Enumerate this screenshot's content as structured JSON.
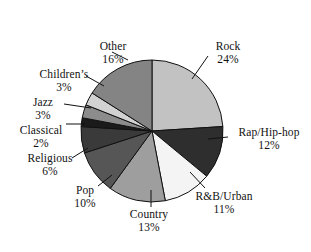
{
  "chart_data": {
    "type": "pie",
    "title": "",
    "subtitle": "",
    "xlabel": "",
    "ylabel": "",
    "legend_position": "none",
    "grid": false,
    "labels_outside": true,
    "value_unit": "%",
    "categories": [
      "Rock",
      "Rap/Hip-hop",
      "R&B/Urban",
      "Country",
      "Pop",
      "Religious",
      "Classical",
      "Jazz",
      "Children's",
      "Other"
    ],
    "values": [
      24,
      12,
      11,
      13,
      10,
      6,
      2,
      3,
      3,
      16
    ],
    "slices": [
      {
        "label": "Rock",
        "value": 24,
        "value_text": "24%",
        "color": "#c2c2c2"
      },
      {
        "label": "Rap/Hip-hop",
        "value": 12,
        "value_text": "12%",
        "color": "#2e2e2e"
      },
      {
        "label": "R&B/Urban",
        "value": 11,
        "value_text": "11%",
        "color": "#f4f4f4"
      },
      {
        "label": "Country",
        "value": 13,
        "value_text": "13%",
        "color": "#9e9e9e"
      },
      {
        "label": "Pop",
        "value": 10,
        "value_text": "10%",
        "color": "#565656"
      },
      {
        "label": "Religious",
        "value": 6,
        "value_text": "6%",
        "color": "#3a3a3a"
      },
      {
        "label": "Classical",
        "value": 2,
        "value_text": "2%",
        "color": "#1b1b1b"
      },
      {
        "label": "Jazz",
        "value": 3,
        "value_text": "3%",
        "color": "#8c8c8c"
      },
      {
        "label": "Children's",
        "value": 3,
        "value_text": "3%",
        "color": "#d2d2d2"
      },
      {
        "label": "Other",
        "value": 16,
        "value_text": "16%",
        "color": "#848484"
      }
    ]
  },
  "callouts": {
    "rock": {
      "label": "Rock",
      "pct": "24%"
    },
    "rap": {
      "label": "Rap/Hip-hop",
      "pct": "12%"
    },
    "rnb": {
      "label": "R&B/Urban",
      "pct": "11%"
    },
    "country": {
      "label": "Country",
      "pct": "13%"
    },
    "pop": {
      "label": "Pop",
      "pct": "10%"
    },
    "religious": {
      "label": "Religious",
      "pct": "6%"
    },
    "classical": {
      "label": "Classical",
      "pct": "2%"
    },
    "jazz": {
      "label": "Jazz",
      "pct": "3%"
    },
    "children": {
      "label": "Children’s",
      "pct": "3%"
    },
    "other": {
      "label": "Other",
      "pct": "16%"
    }
  },
  "style": {
    "background": "#ffffff",
    "stroke": "#111111",
    "text_color": "#111111"
  }
}
